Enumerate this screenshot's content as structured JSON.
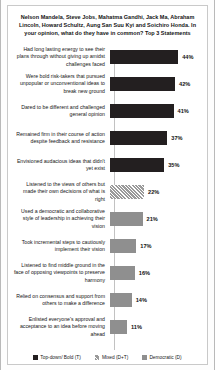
{
  "chart_data": {
    "type": "bar",
    "orientation": "horizontal",
    "title": "Nelson Mandela, Steve Jobs, Mahatma Gandhi, Jack Ma, Abraham Lincoln, Howard Schultz, Aung San Suu Kyi and Soichiro Honda. In your opinion, what do they have in common? Top 3 Statements",
    "xlabel": "",
    "ylabel": "",
    "xlim": [
      0,
      50
    ],
    "grid": false,
    "legend_position": "bottom",
    "value_suffix": "%",
    "categories": [
      "Had long lasting energy to see their plans through without giving up amidst challenges faced",
      "Were bold risk-takers that pursued unpopular or unconventional ideas to break new ground",
      "Dared to be different and challenged general opinion",
      "Remained firm in their course of action despite feedback and resistance",
      "Envisioned audacious  ideas that didn't yet exist",
      "Listened to the views of others but made their own decisions of what is right",
      "Used a democratic and collaborative style of leadership  in achieving their vision",
      "Took incremental steps to cautiously implement their vision",
      "Listened to find middle ground in the face of opposing viewpoints  to preserve harmony",
      "Relied on consensus and support from others to make a difference",
      "Enlisted everyone's approval and acceptance to an idea before moving ahead"
    ],
    "values": [
      44,
      42,
      41,
      37,
      35,
      22,
      21,
      17,
      16,
      14,
      11
    ],
    "value_labels": [
      "44%",
      "42%",
      "41%",
      "37%",
      "35%",
      "22%",
      "21%",
      "17%",
      "16%",
      "14%",
      "11%"
    ],
    "series_of_bar": [
      "top-down",
      "top-down",
      "top-down",
      "top-down",
      "top-down",
      "mixed",
      "democratic",
      "democratic",
      "democratic",
      "democratic",
      "democratic"
    ],
    "legend": [
      {
        "label": "Top-down/ Bold (T)",
        "key": "top-down",
        "color": "#231f20"
      },
      {
        "label": "Mixed (D+T)",
        "key": "mixed",
        "color": "#9a9a9a"
      },
      {
        "label": "Democratic (D)",
        "key": "democratic",
        "color": "#8f8f8f"
      }
    ]
  }
}
